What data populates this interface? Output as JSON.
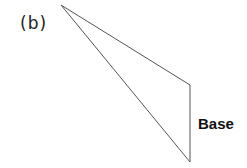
{
  "figure": {
    "panel_label": "(b)",
    "base_label": "Base",
    "triangle": {
      "vertices": [
        [
          61,
          5
        ],
        [
          190,
          85
        ],
        [
          190,
          162
        ]
      ],
      "stroke": "#555555",
      "fill": "none"
    }
  }
}
